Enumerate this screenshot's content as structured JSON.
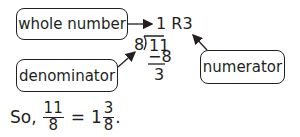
{
  "labels": {
    "whole_number": "whole number",
    "denominator": "denominator",
    "numerator": "numerator"
  },
  "division": {
    "quotient": "1 R3",
    "divisor": "8",
    "dividend": "11",
    "subtract": "−8",
    "remainder": "3"
  },
  "summary": {
    "prefix": "So,",
    "lhs_numerator": "11",
    "lhs_denominator": "8",
    "equals": "=",
    "whole": "1",
    "rhs_numerator": "3",
    "rhs_denominator": "8",
    "suffix": "."
  },
  "colors": {
    "ink": "#231f20",
    "background": "#ffffff"
  }
}
